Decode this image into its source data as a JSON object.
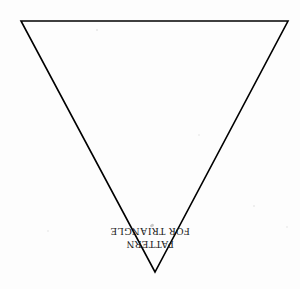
{
  "document": {
    "title": "Pattern for Triangle",
    "background_color": "#fdfdfd",
    "ink_color": "#000000",
    "media": "scanned-paper"
  },
  "figure": {
    "name": "inverted-triangle-outline",
    "shape": "triangle",
    "orientation": "point-down",
    "fill": "none",
    "stroke_color": "#000000",
    "stroke_width": "1.6",
    "vertices": [
      {
        "label": "top-left",
        "x": 21,
        "y": 21
      },
      {
        "label": "top-right",
        "x": 288,
        "y": 21
      },
      {
        "label": "bottom-apex",
        "x": 155,
        "y": 272
      }
    ]
  },
  "caption": {
    "rotation_degrees": 180,
    "color": "#1c1c1c",
    "lines": [
      "PATTERN",
      "FOR TRIANGLE"
    ]
  },
  "artifacts": {
    "smudge_label": "scan smudge",
    "speck_label": "scan speck"
  }
}
